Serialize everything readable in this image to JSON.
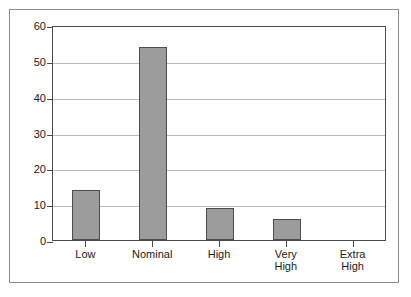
{
  "chart_data": {
    "type": "bar",
    "title": "",
    "subtitle": "",
    "xlabel": "",
    "ylabel": "",
    "categories": [
      "Low",
      "Nominal",
      "High",
      "Very High",
      "Extra High"
    ],
    "category_lines": [
      [
        "Low"
      ],
      [
        "Nominal"
      ],
      [
        "High"
      ],
      [
        "Very",
        "High"
      ],
      [
        "Extra",
        "High"
      ]
    ],
    "values": [
      14,
      54,
      9,
      6,
      0
    ],
    "ylim": [
      0,
      60
    ],
    "ytick_labels": [
      "0",
      "10",
      "20",
      "30",
      "40",
      "50",
      "60"
    ],
    "ytick_values": [
      0,
      10,
      20,
      30,
      40,
      50,
      60
    ],
    "grid": true,
    "grid_axis": "y",
    "legend": false,
    "legend_position": "none",
    "colors": {
      "bar_fill": "#9c9c9c",
      "bar_border": "#4d4d4d",
      "gridline": "#b9b9b9",
      "axis": "#4a4a4a",
      "outer_border": "#8d8d8d",
      "background": "#ffffff",
      "text": "#1a1a1a"
    }
  }
}
